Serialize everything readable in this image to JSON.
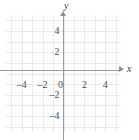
{
  "figure": {
    "kind": "cartesian-coordinate-grid",
    "background_color": "#ffffff",
    "grid_color": "#e9e9e9",
    "axis_color": "#9a9a9a",
    "label_color": "#4b4b4b"
  },
  "axes": {
    "x_name": "x",
    "y_name": "y"
  },
  "chart_data": {
    "type": "scatter",
    "title": "",
    "subtitle": "",
    "xlabel": "x",
    "ylabel": "y",
    "xlim": [
      -5.5,
      5.5
    ],
    "ylim": [
      -5.5,
      5.5
    ],
    "grid": true,
    "grid_spacing": 1,
    "legend": null,
    "series": [],
    "annotations": [],
    "x_tick_values": [
      -4,
      -2,
      0,
      2,
      4
    ],
    "x_tick_labels": [
      "–4",
      "–2",
      "0",
      "2",
      "4"
    ],
    "y_tick_values": [
      4,
      2,
      -2,
      -4
    ],
    "y_tick_labels": [
      "4",
      "2",
      "–2",
      "–4"
    ],
    "x_minor_ticks": [
      -5,
      -4,
      -3,
      -2,
      -1,
      0,
      1,
      2,
      3,
      4,
      5
    ],
    "y_minor_ticks": [
      -5,
      -4,
      -3,
      -2,
      -1,
      0,
      1,
      2,
      3,
      4,
      5
    ]
  }
}
